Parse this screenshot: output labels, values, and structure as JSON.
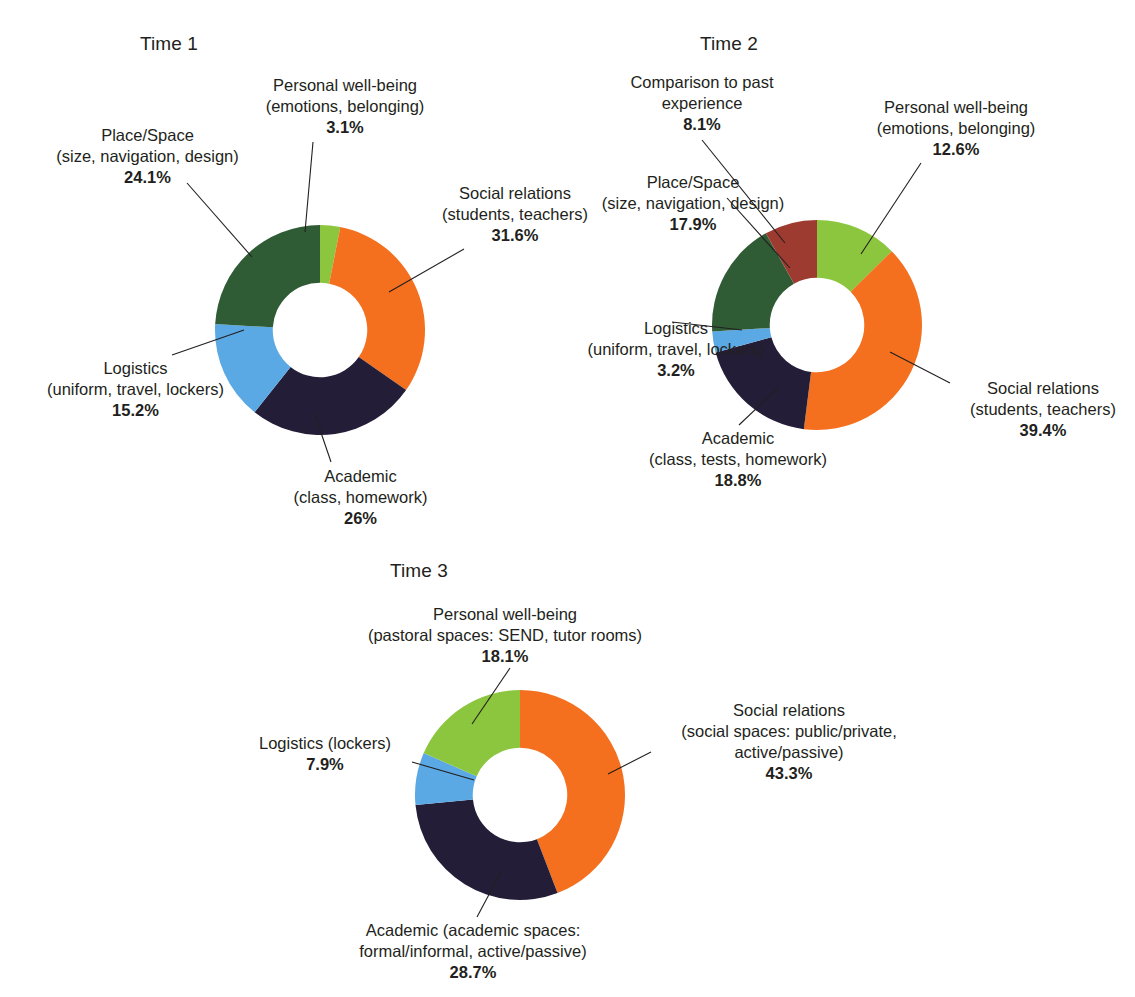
{
  "figure": {
    "background": "#ffffff",
    "palette": {
      "social_relations": "#f4701f",
      "academic": "#231d38",
      "logistics": "#5ba9e4",
      "place_space": "#2f5c35",
      "personal_wellbeing": "#8cc63e",
      "comparison_past": "#9e3b31",
      "leader_line": "#231f20",
      "text": "#231f20"
    }
  },
  "charts": [
    {
      "id": "time-1",
      "title": "Time 1",
      "labels": [
        {
          "key": "personal-wellbeing",
          "lines": [
            "Personal well-being",
            "(emotions, belonging)"
          ],
          "pct": "3.1%"
        },
        {
          "key": "place-space",
          "lines": [
            "Place/Space",
            "(size, navigation, design)"
          ],
          "pct": "24.1%"
        },
        {
          "key": "social-relations",
          "lines": [
            "Social relations",
            "(students, teachers)"
          ],
          "pct": "31.6%"
        },
        {
          "key": "logistics",
          "lines": [
            "Logistics",
            "(uniform, travel, lockers)"
          ],
          "pct": "15.2%"
        },
        {
          "key": "academic",
          "lines": [
            "Academic",
            "(class, homework)"
          ],
          "pct": "26%"
        }
      ]
    },
    {
      "id": "time-2",
      "title": "Time 2",
      "labels": [
        {
          "key": "comparison-past",
          "lines": [
            "Comparison to past",
            "experience"
          ],
          "pct": "8.1%"
        },
        {
          "key": "personal-wellbeing",
          "lines": [
            "Personal well-being",
            "(emotions, belonging)"
          ],
          "pct": "12.6%"
        },
        {
          "key": "place-space",
          "lines": [
            "Place/Space",
            "(size, navigation, design)"
          ],
          "pct": "17.9%"
        },
        {
          "key": "logistics",
          "lines": [
            "Logistics",
            "(uniform, travel, lockers)"
          ],
          "pct": "3.2%"
        },
        {
          "key": "academic",
          "lines": [
            "Academic",
            "(class, tests, homework)"
          ],
          "pct": "18.8%"
        },
        {
          "key": "social-relations",
          "lines": [
            "Social relations",
            "(students, teachers)"
          ],
          "pct": "39.4%"
        }
      ]
    },
    {
      "id": "time-3",
      "title": "Time 3",
      "labels": [
        {
          "key": "personal-wellbeing",
          "lines": [
            "Personal well-being",
            "(pastoral spaces: SEND, tutor rooms)"
          ],
          "pct": "18.1%"
        },
        {
          "key": "social-relations",
          "lines": [
            "Social relations",
            "(social spaces: public/private,",
            "active/passive)"
          ],
          "pct": "43.3%"
        },
        {
          "key": "logistics",
          "lines": [
            "Logistics (lockers)"
          ],
          "pct": "7.9%"
        },
        {
          "key": "academic",
          "lines": [
            "Academic (academic spaces:",
            "formal/informal, active/passive)"
          ],
          "pct": "28.7%"
        }
      ]
    }
  ],
  "chart_data": [
    {
      "type": "pie",
      "variant": "donut",
      "title": "Time 1",
      "categories": [
        "Personal well-being (emotions, belonging)",
        "Social relations (students, teachers)",
        "Academic (class, homework)",
        "Logistics (uniform, travel, lockers)",
        "Place/Space (size, navigation, design)"
      ],
      "values": [
        3.1,
        31.6,
        26,
        15.2,
        24.1
      ],
      "value_labels": [
        "3.1%",
        "31.6%",
        "26%",
        "15.2%",
        "24.1%"
      ],
      "colors": [
        "#8cc63e",
        "#f4701f",
        "#231d38",
        "#5ba9e4",
        "#2f5c35"
      ],
      "units": "percent",
      "total": 100,
      "start_angle_deg": 0,
      "direction": "clockwise",
      "inner_radius_ratio": 0.45,
      "legend": "none",
      "labels_position": "outside-with-leader-lines"
    },
    {
      "type": "pie",
      "variant": "donut",
      "title": "Time 2",
      "categories": [
        "Personal well-being (emotions, belonging)",
        "Social relations (students, teachers)",
        "Academic (class, tests, homework)",
        "Logistics (uniform, travel, lockers)",
        "Place/Space (size, navigation, design)",
        "Comparison to past experience"
      ],
      "values": [
        12.6,
        39.4,
        18.8,
        3.2,
        17.9,
        8.1
      ],
      "value_labels": [
        "12.6%",
        "39.4%",
        "18.8%",
        "3.2%",
        "17.9%",
        "8.1%"
      ],
      "colors": [
        "#8cc63e",
        "#f4701f",
        "#231d38",
        "#5ba9e4",
        "#2f5c35",
        "#9e3b31"
      ],
      "units": "percent",
      "total": 100,
      "start_angle_deg": 0,
      "direction": "clockwise",
      "inner_radius_ratio": 0.45,
      "legend": "none",
      "labels_position": "outside-with-leader-lines"
    },
    {
      "type": "pie",
      "variant": "donut",
      "title": "Time 3",
      "categories": [
        "Social relations (social spaces: public/private, active/passive)",
        "Academic (academic spaces: formal/informal, active/passive)",
        "Logistics (lockers)",
        "Personal well-being (pastoral spaces: SEND, tutor rooms)"
      ],
      "values": [
        43.3,
        28.7,
        7.9,
        18.1
      ],
      "value_labels": [
        "43.3%",
        "28.7%",
        "7.9%",
        "18.1%"
      ],
      "colors": [
        "#f4701f",
        "#231d38",
        "#5ba9e4",
        "#8cc63e"
      ],
      "units": "percent",
      "total": 98,
      "start_angle_deg": 0,
      "direction": "clockwise",
      "inner_radius_ratio": 0.45,
      "legend": "none",
      "labels_position": "outside-with-leader-lines"
    }
  ]
}
